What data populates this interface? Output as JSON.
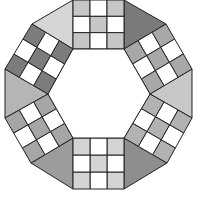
{
  "figure": {
    "stroke": "#222222",
    "white": "#ffffff",
    "hexagon": [
      [
        73,
        49
      ],
      [
        124,
        49
      ],
      [
        150,
        94
      ],
      [
        124,
        138
      ],
      [
        73,
        138
      ],
      [
        48,
        94
      ]
    ],
    "squares": [
      {
        "name": "square-top",
        "corners": [
          [
            73,
            0
          ],
          [
            124,
            0
          ],
          [
            124,
            49
          ],
          [
            73,
            49
          ]
        ],
        "shade": "#c6c6c6"
      },
      {
        "name": "square-upper-right",
        "corners": [
          [
            166,
            24
          ],
          [
            192,
            69
          ],
          [
            150,
            94
          ],
          [
            124,
            49
          ]
        ],
        "shade": "#a8a8a8"
      },
      {
        "name": "square-lower-right",
        "corners": [
          [
            192,
            118
          ],
          [
            167,
            163
          ],
          [
            124,
            138
          ],
          [
            150,
            94
          ]
        ],
        "shade": "#b2b2b2"
      },
      {
        "name": "square-bottom",
        "corners": [
          [
            124,
            189
          ],
          [
            73,
            189
          ],
          [
            73,
            138
          ],
          [
            124,
            138
          ]
        ],
        "shade": "#d4d4d4"
      },
      {
        "name": "square-lower-left",
        "corners": [
          [
            31,
            163
          ],
          [
            5,
            118
          ],
          [
            48,
            94
          ],
          [
            73,
            138
          ]
        ],
        "shade": "#a6a6a6"
      },
      {
        "name": "square-upper-left",
        "corners": [
          [
            5,
            69
          ],
          [
            32,
            24
          ],
          [
            73,
            49
          ],
          [
            48,
            94
          ]
        ],
        "shade": "#7c7c7c"
      }
    ],
    "triangles": [
      {
        "name": "triangle-top-left",
        "points": [
          [
            32,
            24
          ],
          [
            73,
            0
          ],
          [
            73,
            49
          ]
        ],
        "fill": "#d6d6d6"
      },
      {
        "name": "triangle-top-right",
        "points": [
          [
            124,
            0
          ],
          [
            166,
            24
          ],
          [
            124,
            49
          ]
        ],
        "fill": "#7a7a7a"
      },
      {
        "name": "triangle-right",
        "points": [
          [
            192,
            69
          ],
          [
            192,
            118
          ],
          [
            150,
            94
          ]
        ],
        "fill": "#c8c8c8"
      },
      {
        "name": "triangle-bottom-right",
        "points": [
          [
            167,
            163
          ],
          [
            124,
            189
          ],
          [
            124,
            138
          ]
        ],
        "fill": "#8e8e8e"
      },
      {
        "name": "triangle-bottom-left",
        "points": [
          [
            73,
            189
          ],
          [
            31,
            163
          ],
          [
            73,
            138
          ]
        ],
        "fill": "#9c9c9c"
      },
      {
        "name": "triangle-left",
        "points": [
          [
            5,
            118
          ],
          [
            5,
            69
          ],
          [
            48,
            94
          ]
        ],
        "fill": "#b6b6b6"
      }
    ],
    "checker_pattern": [
      [
        1,
        0,
        1
      ],
      [
        0,
        1,
        0
      ],
      [
        1,
        0,
        1
      ]
    ]
  }
}
